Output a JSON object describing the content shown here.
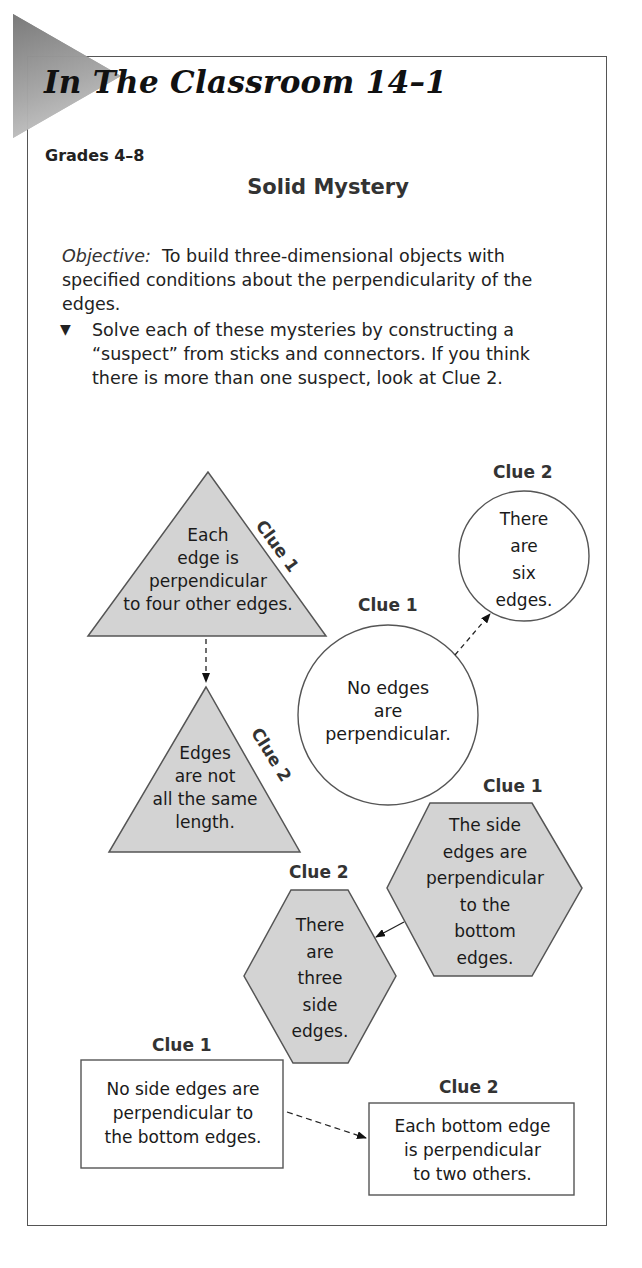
{
  "header": {
    "title": "In The Classroom 14–1",
    "grades": "Grades 4–8",
    "activity_title": "Solid Mystery"
  },
  "objective": {
    "label": "Objective:",
    "text": "To build three-dimensional objects with specified conditions about the perpendicularity of the edges."
  },
  "instructions": {
    "bullet_icon": "triangle-down",
    "text": "Solve each of these mysteries by constructing a “suspect” from sticks and connectors. If you think there is more than one suspect, look at Clue 2."
  },
  "mysteries": [
    {
      "shape": "triangle",
      "fill": "#d3d3d3",
      "clue1": {
        "label": "Clue 1",
        "lines": [
          "Each",
          "edge is",
          "perpendicular",
          "to four other edges."
        ]
      },
      "clue2": {
        "label": "Clue 2",
        "lines": [
          "Edges",
          "are not",
          "all the same",
          "length."
        ]
      }
    },
    {
      "shape": "circle",
      "fill": "#ffffff",
      "clue1": {
        "label": "Clue 1",
        "lines": [
          "No edges",
          "are",
          "perpendicular."
        ]
      },
      "clue2": {
        "label": "Clue 2",
        "lines": [
          "There",
          "are",
          "six",
          "edges."
        ]
      }
    },
    {
      "shape": "hexagon",
      "fill": "#d3d3d3",
      "clue1": {
        "label": "Clue 1",
        "lines": [
          "The side",
          "edges are",
          "perpendicular",
          "to the",
          "bottom",
          "edges."
        ]
      },
      "clue2": {
        "label": "Clue 2",
        "lines": [
          "There",
          "are",
          "three",
          "side",
          "edges."
        ]
      }
    },
    {
      "shape": "rectangle",
      "fill": "#ffffff",
      "clue1": {
        "label": "Clue 1",
        "lines": [
          "No side edges are",
          "perpendicular to",
          "the bottom edges."
        ]
      },
      "clue2": {
        "label": "Clue 2",
        "lines": [
          "Each bottom edge",
          "is perpendicular",
          "to two others."
        ]
      }
    }
  ]
}
